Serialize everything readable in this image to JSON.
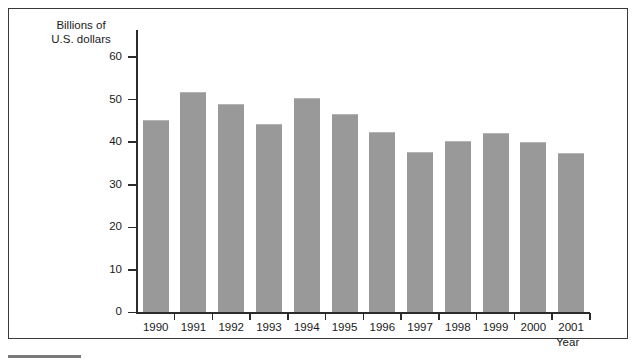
{
  "figure": {
    "frame_border_color": "#3a3a3a",
    "background_color": "#ffffff",
    "footer_rule_color": "#7a7a7a"
  },
  "chart_data": {
    "type": "bar",
    "title": "",
    "subtitle": "",
    "xlabel": "Year",
    "ylabel": "Billions of\nU.S. dollars",
    "ylabel_line1": "Billions of",
    "ylabel_line2": "U.S. dollars",
    "categories": [
      "1990",
      "1991",
      "1992",
      "1993",
      "1994",
      "1995",
      "1996",
      "1997",
      "1998",
      "1999",
      "2000",
      "2001"
    ],
    "values": [
      45.3,
      51.7,
      49.0,
      44.2,
      50.5,
      46.7,
      42.5,
      37.6,
      40.2,
      42.1,
      40.0,
      37.5
    ],
    "ylim": [
      0,
      65
    ],
    "yticks": [
      0,
      10,
      20,
      30,
      40,
      50,
      60
    ],
    "ytick_labels": [
      "0",
      "10",
      "20",
      "30",
      "40",
      "50",
      "60"
    ],
    "bar_color": "#999999",
    "axis_color": "#2b2b2b",
    "grid": false,
    "legend": null,
    "legend_position": "none",
    "annotations": []
  }
}
